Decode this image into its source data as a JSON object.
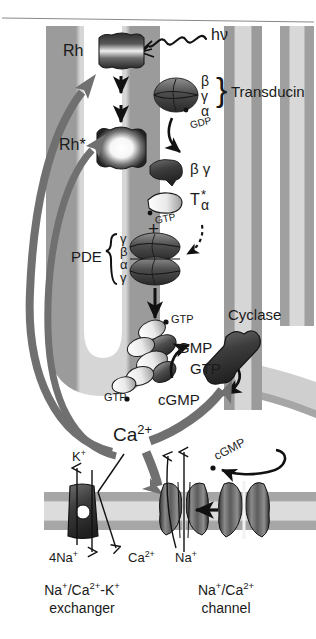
{
  "figure": {
    "type": "biological-pathway-diagram"
  },
  "colors": {
    "background": "#ffffff",
    "disc_edge_dark": "#9b9b9b",
    "disc_interior_light": "#dcdcdc",
    "disc_core_white": "#f2f2f2",
    "protein_dark": "#4a4a4a",
    "protein_mid": "#6e6e6e",
    "protein_light": "#e8e8e8",
    "arrow_black": "#111111",
    "arrow_gray": "#707070",
    "membrane_band": "#a8a8a8",
    "membrane_core": "#d9d9d9",
    "text": "#1a1a1a"
  },
  "labels": {
    "rhodopsin": "Rh",
    "rhodopsin_active": "Rh*",
    "photon": "hν",
    "transducin": "Transducin",
    "transducin_beta": "β",
    "transducin_gamma": "γ",
    "transducin_alpha": "α",
    "gdp": "GDP",
    "beta_gamma": "β γ",
    "t_alpha": "T",
    "t_alpha_sub": "α",
    "t_alpha_star": "*",
    "gtp_bound_talpha": "GTP",
    "plus": "+",
    "pde": "PDE",
    "pde_sub_1": "γ",
    "pde_sub_2": "β",
    "pde_sub_3": "α",
    "pde_sub_4": "γ",
    "gtp_upper": "GTP",
    "gtp_lower": "GTP",
    "gmp": "GMP",
    "gtp_cycle": "GTP",
    "cgmp_cycle": "cGMP",
    "cyclase": "Cyclase",
    "calcium": "Ca",
    "calcium_charge": "2+",
    "cgmp_channel": "cGMP",
    "potassium": "K",
    "potassium_charge": "+",
    "four_sodium": "4Na",
    "four_sodium_charge": "+",
    "calcium_out": "Ca",
    "calcium_out_charge": "2+",
    "sodium_in": "Na",
    "sodium_in_charge": "+"
  },
  "captions": {
    "exchanger_line1_a": "Na",
    "exchanger_line1_sup1": "+",
    "exchanger_line1_b": "/Ca",
    "exchanger_line1_sup2": "2+",
    "exchanger_line1_c": "-K",
    "exchanger_line1_sup3": "+",
    "exchanger_line2": "exchanger",
    "channel_line1_a": "Na",
    "channel_line1_sup1": "+",
    "channel_line1_b": "/Ca",
    "channel_line1_sup2": "2+",
    "channel_line2": "channel"
  },
  "icons": {
    "photon_wave": "photon-wave-icon",
    "rhodopsin_protein": "rhodopsin-protein-icon",
    "rhodopsin_active_protein": "rhodopsin-active-protein-icon",
    "transducin_heterotrimer": "transducin-heterotrimer-icon",
    "beta_gamma_subunit": "beta-gamma-subunit-icon",
    "t_alpha_subunit": "t-alpha-subunit-icon",
    "pde_complex": "pde-complex-icon",
    "pde_activated": "pde-activated-icon",
    "guanylate_cyclase": "guanylate-cyclase-icon",
    "exchanger_protein": "sodium-calcium-potassium-exchanger-icon",
    "channel_protein": "cgmp-gated-channel-icon",
    "channel_protein_closed": "cgmp-gated-channel-closed-icon",
    "disc_membrane": "disc-membrane-icon",
    "plasma_membrane": "plasma-membrane-icon"
  }
}
